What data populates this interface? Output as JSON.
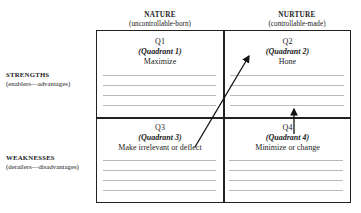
{
  "columns": [
    {
      "title": "NATURE",
      "subtitle": "(uncontrollable-born)"
    },
    {
      "title": "NURTURE",
      "subtitle": "(controllable-made)"
    }
  ],
  "rows": [
    {
      "title": "STRENGTHS",
      "subtitle": "(enablers—advantages)"
    },
    {
      "title": "WEAKNESSES",
      "subtitle": "(derailers—disadvantages)"
    }
  ],
  "quadrants": [
    {
      "id": "Q1",
      "name": "(Quadrant 1)",
      "action": "Maximize",
      "lines": 4
    },
    {
      "id": "Q2",
      "name": "(Quadrant 2)",
      "action": "Hone",
      "lines": 4
    },
    {
      "id": "Q3",
      "name": "(Quadrant 3)",
      "action": "Make irrelevant or deflect",
      "lines": 4
    },
    {
      "id": "Q4",
      "name": "(Quadrant 4)",
      "action": "Minimize or change",
      "lines": 4
    }
  ],
  "arrows": [
    {
      "from": "Q3",
      "to": "Q2",
      "style": "diagonal"
    },
    {
      "from": "Q4",
      "to": "Q2",
      "style": "vertical"
    }
  ],
  "colors": {
    "border": "#222222",
    "writing_lines": "#b8b8b8"
  }
}
